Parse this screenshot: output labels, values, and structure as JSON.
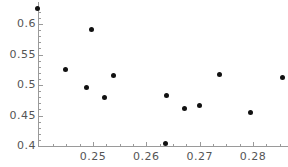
{
  "chart_data": {
    "type": "scatter",
    "title": "",
    "subtitle": "",
    "xlabel": "",
    "ylabel": "",
    "xlim": [
      0.2396,
      0.2868
    ],
    "ylim": [
      0.4,
      0.638
    ],
    "grid": false,
    "legend": null,
    "x_ticks": [
      {
        "value": 0.25,
        "label": "0.25"
      },
      {
        "value": 0.26,
        "label": "0.26"
      },
      {
        "value": 0.27,
        "label": "0.27"
      },
      {
        "value": 0.28,
        "label": "0.28"
      }
    ],
    "x_minor_ticks": [
      0.2425,
      0.245,
      0.2475,
      0.2525,
      0.255,
      0.2575,
      0.2625,
      0.265,
      0.2675,
      0.2725,
      0.275,
      0.2775,
      0.2825,
      0.285
    ],
    "y_ticks": [
      {
        "value": 0.6,
        "label": "0.6"
      },
      {
        "value": 0.55,
        "label": "0.55"
      },
      {
        "value": 0.5,
        "label": "0.5"
      },
      {
        "value": 0.45,
        "label": "0.45"
      },
      {
        "value": 0.4,
        "label": "0.4"
      }
    ],
    "y_minor_ticks": [
      0.41,
      0.42,
      0.43,
      0.44,
      0.46,
      0.47,
      0.48,
      0.49,
      0.51,
      0.52,
      0.53,
      0.54,
      0.56,
      0.57,
      0.58,
      0.59,
      0.61,
      0.62
    ],
    "marker": {
      "shape": "circle",
      "color": "#111111",
      "size_px": 5
    },
    "axis_color": "#9a9a9a",
    "label_color": "#555555",
    "points": [
      {
        "x": 0.2396,
        "y": 0.6248
      },
      {
        "x": 0.2498,
        "y": 0.5902
      },
      {
        "x": 0.2449,
        "y": 0.5246
      },
      {
        "x": 0.2538,
        "y": 0.5148
      },
      {
        "x": 0.2487,
        "y": 0.4951
      },
      {
        "x": 0.2521,
        "y": 0.4787
      },
      {
        "x": 0.2638,
        "y": 0.4836
      },
      {
        "x": 0.2672,
        "y": 0.4607
      },
      {
        "x": 0.27,
        "y": 0.4656
      },
      {
        "x": 0.2738,
        "y": 0.5164
      },
      {
        "x": 0.2855,
        "y": 0.5115
      },
      {
        "x": 0.2796,
        "y": 0.4541
      },
      {
        "x": 0.2636,
        "y": 0.4049
      }
    ]
  }
}
